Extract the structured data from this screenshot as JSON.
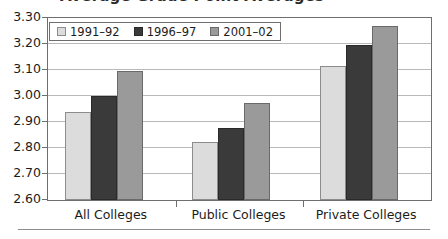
{
  "figure": {
    "title_partial": "Average Grade Point Averages",
    "bottom_rule": true
  },
  "legend": {
    "position": "top-left-inside",
    "entries": [
      {
        "label": "1991–92",
        "color": "#dcdcdc",
        "swatch": "legend-swatch-1991-92"
      },
      {
        "label": "1996–97",
        "color": "#3a3a3a",
        "swatch": "legend-swatch-1996-97"
      },
      {
        "label": "2001–02",
        "color": "#9a9a9a",
        "swatch": "legend-swatch-2001-02"
      }
    ]
  },
  "axes": {
    "y_ticks": [
      "3.30",
      "3.20",
      "3.10",
      "3.00",
      "2.90",
      "2.80",
      "2.70",
      "2.60"
    ],
    "x_ticks": [
      "All Colleges",
      "Public Colleges",
      "Private Colleges"
    ]
  },
  "chart_data": {
    "type": "bar",
    "title": "Average Grade Point Averages",
    "xlabel": "",
    "ylabel": "",
    "ylim": [
      2.6,
      3.3
    ],
    "ytick_step": 0.1,
    "grid": true,
    "legend_position": "top-left-inside",
    "categories": [
      "All Colleges",
      "Public Colleges",
      "Private Colleges"
    ],
    "series": [
      {
        "name": "1991–92",
        "color": "#dcdcdc",
        "values": [
          2.94,
          2.825,
          3.117
        ]
      },
      {
        "name": "1996–97",
        "color": "#3a3a3a",
        "values": [
          3.0,
          2.878,
          3.198
        ]
      },
      {
        "name": "2001–02",
        "color": "#9a9a9a",
        "values": [
          3.095,
          2.975,
          3.268
        ]
      }
    ]
  }
}
